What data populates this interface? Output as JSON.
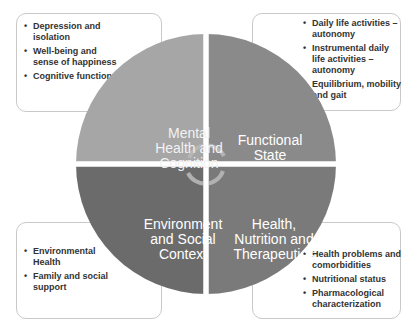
{
  "diagram": {
    "quadrants": [
      {
        "id": "mental",
        "label": "Mental Health and Cognition",
        "lines": [
          "Mental",
          "Health and",
          "Cognition"
        ],
        "color": "#a6a6a6"
      },
      {
        "id": "functional",
        "label": "Functional State",
        "lines": [
          "Functional",
          "State"
        ],
        "color": "#8a8a8a"
      },
      {
        "id": "environment",
        "label": "Environment and Social Context",
        "lines": [
          "Environment",
          "and Social",
          "Context"
        ],
        "color": "#6b6b6b"
      },
      {
        "id": "health",
        "label": "Health, Nutrition and Therapeutics",
        "lines": [
          "Health,",
          "Nutrition and",
          "Therapeutics"
        ],
        "color": "#7a7a7a"
      }
    ],
    "center_icon": "cycle-arrows-icon",
    "boxes": {
      "top_left": [
        "Depression and isolation",
        "Well-being and sense of happiness",
        "Cognitive functions"
      ],
      "top_right": [
        "Daily life activities – autonomy",
        "Instrumental daily life activities – autonomy",
        "Equilibrium, mobility and gait"
      ],
      "bottom_left": [
        "Environmental Health",
        "Family and social support"
      ],
      "bottom_right": [
        "Health problems and comorbidities",
        "Nutritional status",
        "Pharmacological characterization"
      ]
    }
  }
}
